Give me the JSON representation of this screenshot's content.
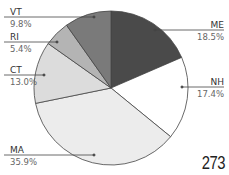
{
  "chart_data": {
    "type": "pie",
    "title": "",
    "start_angle_deg": 0,
    "direction": "clockwise",
    "slices": [
      {
        "label": "ME",
        "value": 18.5,
        "value_label": "18.5%",
        "color": "#4a4a4a"
      },
      {
        "label": "NH",
        "value": 17.4,
        "value_label": "17.4%",
        "color": "#ffffff"
      },
      {
        "label": "MA",
        "value": 35.9,
        "value_label": "35.9%",
        "color": "#ececec"
      },
      {
        "label": "CT",
        "value": 13.0,
        "value_label": "13.0%",
        "color": "#dcdcdc"
      },
      {
        "label": "RI",
        "value": 5.4,
        "value_label": "5.4%",
        "color": "#b4b4b4"
      },
      {
        "label": "VT",
        "value": 9.8,
        "value_label": "9.8%",
        "color": "#7a7a7a"
      }
    ],
    "legend": "none (leader-line labels)",
    "border_color": "#444444"
  },
  "labels": {
    "me": {
      "name": "ME",
      "pct": "18.5%"
    },
    "nh": {
      "name": "NH",
      "pct": "17.4%"
    },
    "ma": {
      "name": "MA",
      "pct": "35.9%"
    },
    "ct": {
      "name": "CT",
      "pct": "13.0%"
    },
    "ri": {
      "name": "RI",
      "pct": "5.4%"
    },
    "vt": {
      "name": "VT",
      "pct": "9.8%"
    }
  },
  "page": {
    "number": "273"
  }
}
